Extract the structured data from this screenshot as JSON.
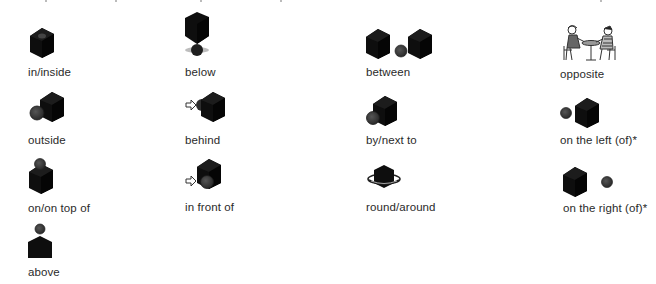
{
  "prepositions": [
    {
      "id": "in-inside",
      "label": "in/inside"
    },
    {
      "id": "below",
      "label": "below"
    },
    {
      "id": "between",
      "label": "between"
    },
    {
      "id": "opposite",
      "label": "opposite"
    },
    {
      "id": "outside",
      "label": "outside"
    },
    {
      "id": "behind",
      "label": "behind"
    },
    {
      "id": "by-next-to",
      "label": "by/next to"
    },
    {
      "id": "on-the-left-of",
      "label": "on the left (of)*"
    },
    {
      "id": "on-on-top-of",
      "label": "on/on top of"
    },
    {
      "id": "in-front-of",
      "label": "in front of"
    },
    {
      "id": "round-around",
      "label": "round/around"
    },
    {
      "id": "on-the-right-of",
      "label": "on the right (of)*"
    },
    {
      "id": "above",
      "label": "above"
    }
  ],
  "colors": {
    "cube": "#111111",
    "ball": "#3a3a3a",
    "text": "#2a2a2a"
  }
}
